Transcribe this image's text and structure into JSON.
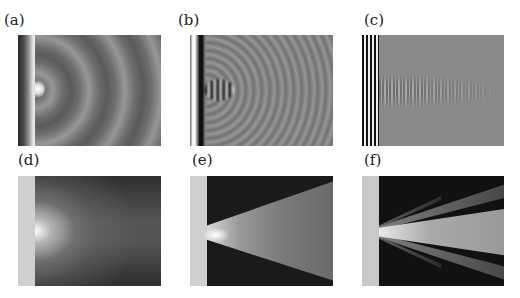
{
  "figure": {
    "panels": [
      {
        "id": "a",
        "label": "(a)",
        "description": "Wave field, long wavelength, concentric wavefronts from slit",
        "source_strip": "dark-to-light gradient",
        "background": "gray"
      },
      {
        "id": "b",
        "label": "(b)",
        "description": "Wave field, medium wavelength, concentric wavefronts from slit",
        "source_strip": "white/black bands",
        "background": "gray"
      },
      {
        "id": "c",
        "label": "(c)",
        "description": "Wave field, short wavelength, narrow collimated wavefronts",
        "source_strip": "fine black/white stripes",
        "background": "gray"
      },
      {
        "id": "d",
        "label": "(d)",
        "description": "Intensity pattern, broad diffraction spread",
        "source_strip": "light gray",
        "background": "dark gray"
      },
      {
        "id": "e",
        "label": "(e)",
        "description": "Intensity pattern, cone-shaped beam",
        "source_strip": "light gray",
        "background": "black"
      },
      {
        "id": "f",
        "label": "(f)",
        "description": "Intensity pattern, narrow beam with side lobes",
        "source_strip": "light gray",
        "background": "black"
      }
    ]
  }
}
